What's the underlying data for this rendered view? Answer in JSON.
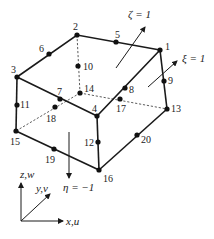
{
  "diagram": {
    "nodes": [
      {
        "id": "1",
        "x": 160,
        "y": 50,
        "lx": 165,
        "ly": 50
      },
      {
        "id": "2",
        "x": 77,
        "y": 35,
        "lx": 73,
        "ly": 30
      },
      {
        "id": "3",
        "x": 17,
        "y": 77,
        "lx": 11,
        "ly": 73
      },
      {
        "id": "4",
        "x": 97,
        "y": 116,
        "lx": 92,
        "ly": 112
      },
      {
        "id": "5",
        "x": 116,
        "y": 42,
        "lx": 115,
        "ly": 38
      },
      {
        "id": "6",
        "x": 49,
        "y": 54,
        "lx": 39,
        "ly": 52
      },
      {
        "id": "7",
        "x": 60,
        "y": 99,
        "lx": 57,
        "ly": 95
      },
      {
        "id": "8",
        "x": 125,
        "y": 88,
        "lx": 129,
        "ly": 93
      },
      {
        "id": "9",
        "x": 164,
        "y": 81,
        "lx": 168,
        "ly": 84
      },
      {
        "id": "10",
        "x": 78,
        "y": 66,
        "lx": 83,
        "ly": 70
      },
      {
        "id": "11",
        "x": 17,
        "y": 105,
        "lx": 20,
        "ly": 108
      },
      {
        "id": "12",
        "x": 98,
        "y": 142,
        "lx": 84,
        "ly": 146
      },
      {
        "id": "13",
        "x": 167,
        "y": 109,
        "lx": 171,
        "ly": 112
      },
      {
        "id": "14",
        "x": 80,
        "y": 93,
        "lx": 84,
        "ly": 92
      },
      {
        "id": "15",
        "x": 16,
        "y": 131,
        "lx": 10,
        "ly": 145
      },
      {
        "id": "16",
        "x": 99,
        "y": 170,
        "lx": 103,
        "ly": 182
      },
      {
        "id": "17",
        "x": 120,
        "y": 99,
        "lx": 116,
        "ly": 112
      },
      {
        "id": "18",
        "x": 55,
        "y": 107,
        "lx": 46,
        "ly": 122
      },
      {
        "id": "19",
        "x": 54,
        "y": 149,
        "lx": 45,
        "ly": 163
      },
      {
        "id": "20",
        "x": 137,
        "y": 135,
        "lx": 141,
        "ly": 143
      }
    ],
    "arrows": {
      "zeta": {
        "label": "ζ = 1"
      },
      "xi": {
        "label": "ξ = 1"
      },
      "eta": {
        "label": "η = −1"
      }
    },
    "axes": {
      "z": "z,w",
      "y": "y,v",
      "x": "x,u"
    }
  }
}
